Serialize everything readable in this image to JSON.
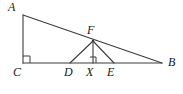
{
  "figure": {
    "kind": "geometry-diagram",
    "background_color": "#ffffff",
    "stroke_color": "#3c3c3c",
    "label_color": "#1a1a1a",
    "points": [
      {
        "id": "A",
        "label": "A",
        "x": 23,
        "y": 15,
        "label_x": 8,
        "label_y": 1
      },
      {
        "id": "C",
        "label": "C",
        "x": 23,
        "y": 63,
        "label_x": 13,
        "label_y": 66
      },
      {
        "id": "B",
        "label": "B",
        "x": 162,
        "y": 63,
        "label_x": 168,
        "label_y": 56
      },
      {
        "id": "F",
        "label": "F",
        "x": 93,
        "y": 41,
        "label_x": 87,
        "label_y": 24
      },
      {
        "id": "D",
        "label": "D",
        "x": 70,
        "y": 63,
        "label_x": 64,
        "label_y": 66
      },
      {
        "id": "X",
        "label": "X",
        "x": 93,
        "y": 63,
        "label_x": 86,
        "label_y": 66
      },
      {
        "id": "E",
        "label": "E",
        "x": 114,
        "y": 63,
        "label_x": 107,
        "label_y": 66
      }
    ],
    "segments": [
      {
        "id": "AC",
        "from": "A",
        "to": "C"
      },
      {
        "id": "CB",
        "from": "C",
        "to": "B"
      },
      {
        "id": "AB",
        "from": "A",
        "to": "B"
      },
      {
        "id": "FD",
        "from": "F",
        "to": "D"
      },
      {
        "id": "FX",
        "from": "F",
        "to": "X"
      },
      {
        "id": "FE",
        "from": "F",
        "to": "E"
      }
    ],
    "right_angle_marks": [
      {
        "id": "right-angle-at-C",
        "at": "C",
        "x": 23,
        "y": 56,
        "size": 7
      },
      {
        "id": "right-angle-at-X",
        "at": "X",
        "x": 90,
        "y": 57,
        "size": 6
      }
    ]
  }
}
